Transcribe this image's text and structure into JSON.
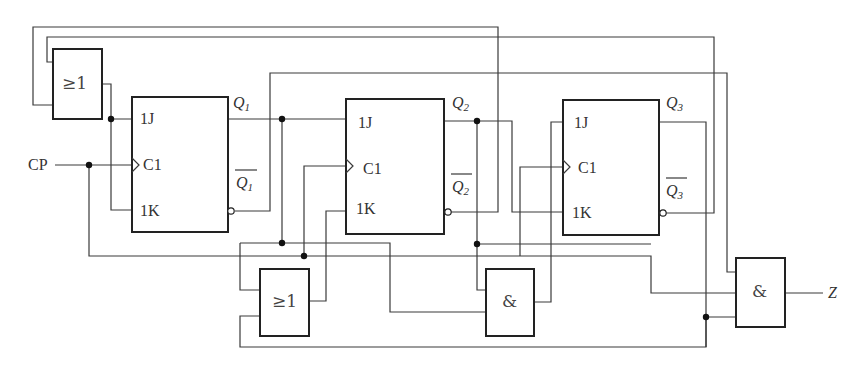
{
  "diagram": {
    "type": "sequential-logic-circuit",
    "input_label": "CP",
    "output_label": "Z",
    "flip_flops": [
      {
        "id": "FF1",
        "pins": {
          "j": "1J",
          "clk": "C1",
          "k": "1K"
        },
        "q": "Q",
        "q_sub": "1",
        "qbar": "Q",
        "qbar_sub": "1"
      },
      {
        "id": "FF2",
        "pins": {
          "j": "1J",
          "clk": "C1",
          "k": "1K"
        },
        "q": "Q",
        "q_sub": "2",
        "qbar": "Q",
        "qbar_sub": "2"
      },
      {
        "id": "FF3",
        "pins": {
          "j": "1J",
          "clk": "C1",
          "k": "1K"
        },
        "q": "Q",
        "q_sub": "3",
        "qbar": "Q",
        "qbar_sub": "3"
      }
    ],
    "gates": [
      {
        "id": "OR1",
        "label": "≥1",
        "kind": "OR"
      },
      {
        "id": "OR2",
        "label": "≥1",
        "kind": "OR"
      },
      {
        "id": "AND1",
        "label": "&",
        "kind": "AND"
      },
      {
        "id": "AND2",
        "label": "&",
        "kind": "AND"
      }
    ],
    "colors": {
      "line": "#3a3a3a",
      "box": "#222222",
      "background": "#ffffff"
    }
  }
}
